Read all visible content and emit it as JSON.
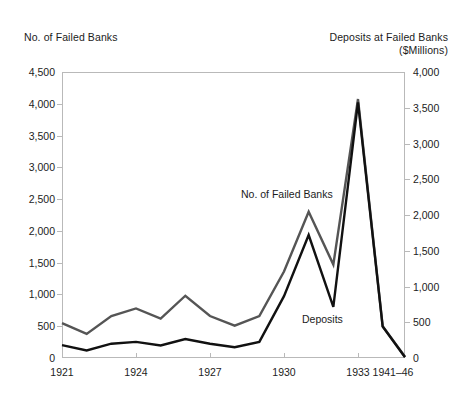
{
  "figure": {
    "left_axis_title": "No. of Failed Banks",
    "right_axis_title_line1": "Deposits at Failed Banks",
    "right_axis_title_line2": "($Millions)",
    "label_failed_banks": "No. of Failed Banks",
    "label_deposits": "Deposits",
    "colors": {
      "failed_banks_line": "#555555",
      "deposits_line": "#111111",
      "frame": "#b9b9b9",
      "text": "#1c1c1c",
      "background": "#ffffff"
    }
  },
  "chart_data": {
    "type": "line",
    "title": "",
    "subtitle": "",
    "xlabel": "",
    "ylabel": "No. of Failed Banks",
    "y2label": "Deposits at Failed Banks ($Millions)",
    "grid": false,
    "legend": "inline-annotations",
    "ylim": [
      0,
      4500
    ],
    "y2lim": [
      0,
      4000
    ],
    "ytick_labels": [
      "4,500",
      "4,000",
      "3,500",
      "3,000",
      "2,500",
      "2,000",
      "1,500",
      "1,000",
      "500",
      "0"
    ],
    "ytick_values": [
      4500,
      4000,
      3500,
      3000,
      2500,
      2000,
      1500,
      1000,
      500,
      0
    ],
    "y2tick_labels": [
      "4,000",
      "3,500",
      "3,000",
      "2,500",
      "2,000",
      "1,500",
      "1,000",
      "500",
      "0"
    ],
    "y2tick_values": [
      4000,
      3500,
      3000,
      2500,
      2000,
      1500,
      1000,
      500,
      0
    ],
    "xtick_labels": [
      "1921",
      "1924",
      "1927",
      "1930",
      "1933",
      "1941–46"
    ],
    "xtick_years": [
      1921,
      1924,
      1927,
      1930,
      1933,
      1941
    ],
    "x": [
      1921,
      1922,
      1923,
      1924,
      1925,
      1926,
      1927,
      1928,
      1929,
      1930,
      1931,
      1932,
      1933,
      1934,
      1941
    ],
    "series": [
      {
        "name": "No. of Failed Banks",
        "axis": "left",
        "color": "#555555",
        "values": [
          550,
          380,
          660,
          780,
          620,
          980,
          660,
          510,
          660,
          1360,
          2300,
          1470,
          4075,
          500,
          20
        ]
      },
      {
        "name": "Deposits",
        "axis": "right",
        "color": "#111111",
        "values": [
          180,
          105,
          200,
          225,
          175,
          265,
          200,
          150,
          225,
          865,
          1720,
          715,
          3575,
          440,
          10
        ]
      }
    ],
    "annotations": [
      {
        "text": "No. of Failed Banks",
        "x": 1930,
        "y": 2600
      },
      {
        "text": "Deposits",
        "x": 1932,
        "y": 800
      }
    ]
  }
}
